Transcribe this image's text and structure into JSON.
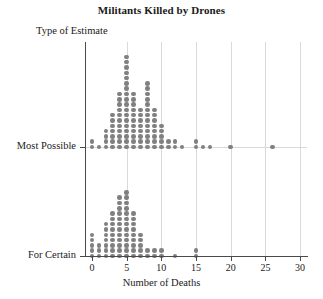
{
  "chart": {
    "title": "Militants Killed by Drones",
    "xlabel": "Number of Deaths",
    "ylabel": "Type of Estimate"
  },
  "chart_data": {
    "type": "scatter",
    "subtype": "dotplot",
    "title": "Militants Killed by Drones",
    "xlabel": "Number of Deaths",
    "ylabel": "Type of Estimate",
    "xlim": [
      -1,
      31
    ],
    "xticks": [
      0,
      5,
      10,
      15,
      20,
      25,
      30
    ],
    "xticklabels": [
      "0",
      "5",
      "10",
      "15",
      "20",
      "25",
      "30"
    ],
    "categories": [
      "Most Possible",
      "For Certain"
    ],
    "grid": "vertical",
    "legend": "none",
    "dot_color": "#808080",
    "series": [
      {
        "name": "Most Possible",
        "x": [
          0,
          1,
          2,
          3,
          4,
          5,
          6,
          7,
          8,
          9,
          10,
          11,
          12,
          13,
          14,
          15,
          16,
          17,
          18,
          20,
          22,
          26
        ],
        "counts": [
          2,
          1,
          4,
          7,
          11,
          18,
          11,
          8,
          13,
          8,
          5,
          2,
          2,
          1,
          0,
          2,
          1,
          1,
          0,
          1,
          0,
          1
        ]
      },
      {
        "name": "For Certain",
        "x": [
          0,
          1,
          2,
          3,
          4,
          5,
          6,
          7,
          8,
          9,
          10,
          12,
          15
        ],
        "counts": [
          5,
          3,
          7,
          9,
          12,
          13,
          9,
          5,
          2,
          2,
          2,
          1,
          2
        ]
      }
    ]
  }
}
